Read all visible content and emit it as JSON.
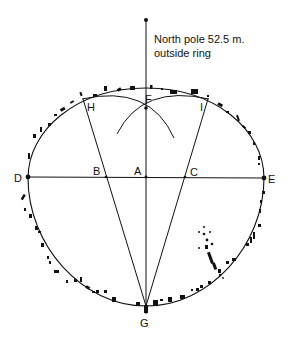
{
  "annotation": {
    "line1": "North pole 52.5 m.",
    "line2": "outside ring"
  },
  "points": {
    "A": "A",
    "B": "B",
    "C": "C",
    "D": "D",
    "E": "E",
    "F": "F",
    "G": "G",
    "H": "H",
    "I": "I"
  },
  "colors": {
    "ink": "#111111",
    "background": "#ffffff"
  }
}
